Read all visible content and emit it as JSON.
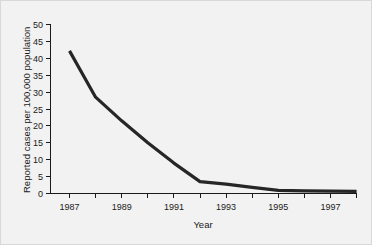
{
  "chart_data": {
    "type": "line",
    "title": "",
    "subtitle": "",
    "xlabel": "Year",
    "ylabel": "Reported cases per 100,000 population",
    "xlim": [
      1987,
      1998
    ],
    "ylim": [
      0,
      50
    ],
    "grid": false,
    "legend": false,
    "x": [
      1987,
      1988,
      1989,
      1990,
      1991,
      1992,
      1993,
      1994,
      1995,
      1996,
      1997,
      1998
    ],
    "xtick_values": [
      1987,
      1988,
      1989,
      1990,
      1991,
      1992,
      1993,
      1994,
      1995,
      1996,
      1997,
      1998
    ],
    "xtick_labels": [
      "1987",
      "",
      "1989",
      "",
      "1991",
      "",
      "1993",
      "",
      "1995",
      "",
      "1997",
      ""
    ],
    "ytick_values": [
      0,
      5,
      10,
      15,
      20,
      25,
      30,
      35,
      40,
      45,
      50
    ],
    "ytick_labels": [
      "0",
      "5",
      "10",
      "15",
      "20",
      "25",
      "30",
      "35",
      "40",
      "45",
      "50"
    ],
    "series": [
      {
        "name": "Reported cases per 100,000 population",
        "values": [
          42.2,
          28.5,
          21.5,
          15.0,
          9.0,
          3.5,
          2.8,
          1.8,
          0.9,
          0.8,
          0.7,
          0.6
        ],
        "color": "#262626"
      }
    ]
  },
  "figure": {
    "background_color": "#f2f2f2",
    "border_color": "#d8d8d8",
    "axis_color": "#1a1a1a",
    "line_color": "#262626"
  }
}
